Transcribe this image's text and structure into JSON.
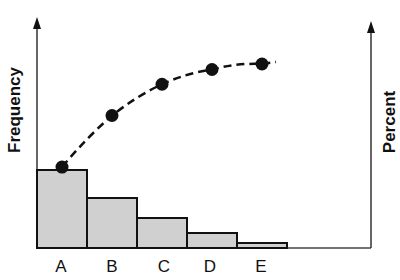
{
  "chart_data": {
    "type": "bar",
    "subtype": "pareto",
    "title": "",
    "xlabel": "",
    "ylabel": "Frequency",
    "y2label": "Percent",
    "categories": [
      "A",
      "B",
      "C",
      "D",
      "E"
    ],
    "series": [
      {
        "name": "Frequency",
        "type": "bar",
        "values": [
          78,
          50,
          30,
          15,
          5
        ]
      },
      {
        "name": "Cumulative Percent",
        "type": "line",
        "style": "dashed",
        "marker": "circle",
        "values": [
          44,
          72,
          89,
          97,
          100
        ]
      }
    ],
    "grid": false,
    "legend": "none",
    "tick_values_shown": false,
    "colors": {
      "bar_fill": "#d0d0d0",
      "bar_stroke": "#111111",
      "line": "#111111",
      "axis": "#333333"
    }
  },
  "labels": {
    "y_left": "Frequency",
    "y_right": "Percent",
    "categories": [
      "A",
      "B",
      "C",
      "D",
      "E"
    ]
  }
}
